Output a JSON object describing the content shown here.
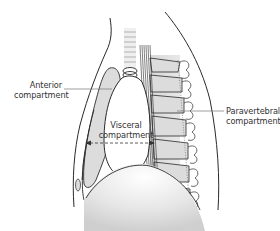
{
  "figure": {
    "type": "anatomical-diagram",
    "labels": {
      "anterior": [
        "Anterior",
        "compartment"
      ],
      "visceral": [
        "Visceral",
        "compartment"
      ],
      "paravertebral": [
        "Paravertebral",
        "compartment"
      ]
    },
    "colors": {
      "outline": "#2a2a2a",
      "fill_gray": "#dcdcdc",
      "fill_light": "#eeeeee",
      "label_text": "#333333",
      "leader_line": "#777777"
    }
  }
}
